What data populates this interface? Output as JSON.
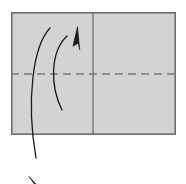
{
  "figure": {
    "canvas": {
      "width": 186,
      "height": 184,
      "background": "#ffffff"
    },
    "colors": {
      "paper_fill": "#d3d3d3",
      "paper_stroke": "#6e6e6e",
      "crease_solid": "#6e6e6e",
      "crease_dashed": "#7a7a7a",
      "arrow": "#1a1a1a"
    },
    "paper": {
      "label": "paper-sheet",
      "x": 11,
      "y": 12,
      "width": 165,
      "height": 123,
      "stroke_width": 1.6
    },
    "creases": [
      {
        "name": "vertical-center-crease",
        "style": "solid",
        "x1": 93,
        "y1": 12,
        "x2": 93,
        "y2": 135,
        "stroke_width": 1.3
      },
      {
        "name": "horizontal-center-fold-line",
        "style": "dashed",
        "x1": 11,
        "y1": 74,
        "x2": 176,
        "y2": 74,
        "stroke_width": 1.4,
        "dash": "8 5"
      }
    ],
    "arrows": [
      {
        "name": "fold-up-arrow",
        "direction": "up-right",
        "path": "M 62 110 C 50 86 50 52 67 36",
        "head": {
          "tip_x": 78,
          "tip_y": 29,
          "angle_deg": -40
        },
        "stroke_width": 1.3
      },
      {
        "name": "unfold-down-arrow",
        "direction": "down-left",
        "path": "M 50 28 C 33 46 26 100 36 158",
        "head": {
          "tip_x": 31,
          "tip_y": 177,
          "angle_deg": 104
        },
        "stroke_width": 1.3
      }
    ]
  }
}
